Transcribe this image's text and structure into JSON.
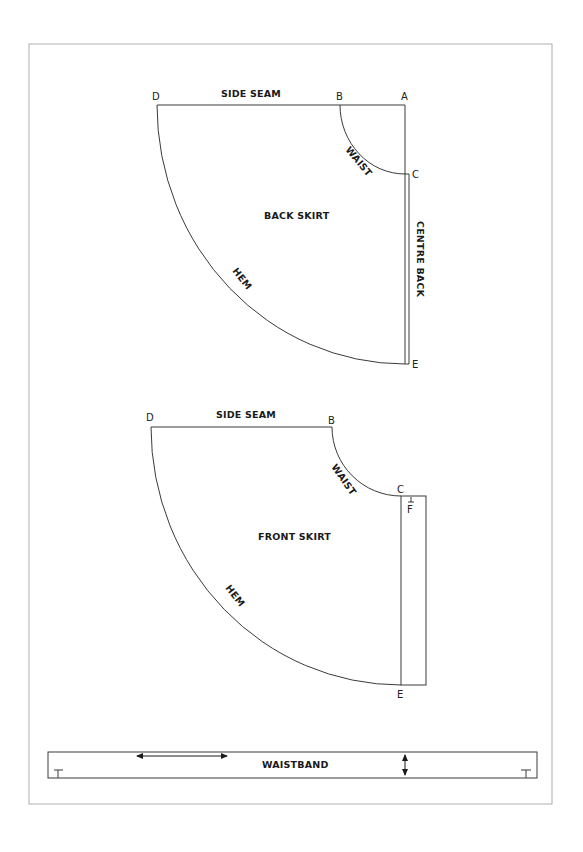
{
  "colors": {
    "line": "#3a3a3a",
    "frame": "#bdbdbd",
    "text": "#1a1a1a",
    "background": "#ffffff"
  },
  "back_skirt": {
    "title": "BACK SKIRT",
    "side_seam": "SIDE SEAM",
    "waist": "WAIST",
    "hem": "HEM",
    "centre": "CENTRE BACK",
    "points": {
      "A": "A",
      "B": "B",
      "C": "C",
      "D": "D",
      "E": "E"
    }
  },
  "front_skirt": {
    "title": "FRONT SKIRT",
    "side_seam": "SIDE SEAM",
    "waist": "WAIST",
    "hem": "HEM",
    "points": {
      "B": "B",
      "C": "C",
      "D": "D",
      "E": "E",
      "F": "F"
    }
  },
  "waistband": {
    "title": "WAISTBAND",
    "grainline_icon": "horizontal-double-arrow",
    "fold_icon": "vertical-double-arrow"
  }
}
